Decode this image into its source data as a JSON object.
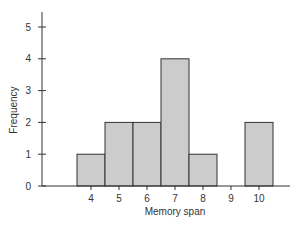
{
  "chart_data": {
    "type": "bar",
    "subtype": "histogram",
    "title": "",
    "xlabel": "Memory span",
    "ylabel": "Frequency",
    "categories": [
      "4",
      "5",
      "6",
      "7",
      "8",
      "9",
      "10"
    ],
    "values": [
      1,
      2,
      2,
      4,
      1,
      0,
      2
    ],
    "ylim": [
      0,
      5
    ],
    "yticks": [
      "0",
      "1",
      "2",
      "3",
      "4",
      "5"
    ],
    "grid": false,
    "legend": null,
    "bar_color": "#cccccc",
    "edge_color": "#333333"
  }
}
